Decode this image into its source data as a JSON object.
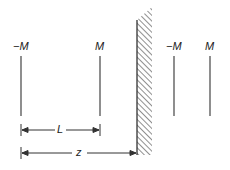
{
  "diagram": {
    "charges": [
      {
        "label": "−M",
        "x": 21
      },
      {
        "label": "M",
        "x": 100
      },
      {
        "label": "−M",
        "x": 174
      },
      {
        "label": "M",
        "x": 210
      }
    ],
    "dimensions": {
      "L_label": "L",
      "z_label": "z"
    },
    "colors": {
      "line": "#333333",
      "hatch": "#444444"
    }
  }
}
